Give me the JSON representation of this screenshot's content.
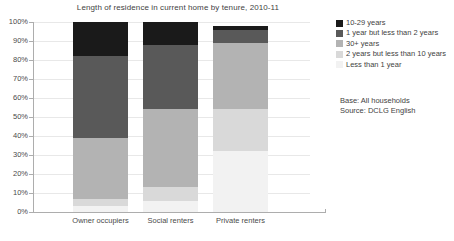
{
  "chart_data": {
    "type": "bar",
    "subtype": "stacked-100-percent",
    "title": "Length of residence in current home by tenure, 2010-11",
    "xlabel": "",
    "ylabel": "",
    "ylim": [
      0,
      100
    ],
    "ytick_labels": [
      "100%",
      "90%",
      "80%",
      "70%",
      "60%",
      "50%",
      "40%",
      "30%",
      "20%",
      "10%",
      "0%"
    ],
    "ytick_values": [
      100,
      90,
      80,
      70,
      60,
      50,
      40,
      30,
      20,
      10,
      0
    ],
    "grid": true,
    "legend_position": "right",
    "categories": [
      "Owner occupiers",
      "Social renters",
      "Private renters"
    ],
    "series": [
      {
        "name": "Less than 1 year",
        "color": "#f2f2f2",
        "values": [
          3,
          6,
          32
        ]
      },
      {
        "name": "2 years but less than 10 years",
        "color": "#d9d9d9",
        "values": [
          4,
          7,
          22
        ]
      },
      {
        "name": "30+ years",
        "color": "#b3b3b3",
        "values": [
          32,
          41,
          35
        ]
      },
      {
        "name": "1 year but less than 2 years",
        "color": "#595959",
        "values": [
          43,
          34,
          7
        ]
      },
      {
        "name": "10-29 years",
        "color": "#1a1a1a",
        "values": [
          18,
          12,
          2
        ]
      }
    ],
    "legend_order": [
      "10-29 years",
      "1 year but less than 2 years",
      "30+ years",
      "2 years but less than 10 years",
      "Less than 1 year"
    ],
    "annotations": [
      "Base: All households",
      "Source: DCLG English"
    ]
  },
  "legend": {
    "items": [
      {
        "label": "10-29 years",
        "color": "#1a1a1a"
      },
      {
        "label": "1 year but less than 2 years",
        "color": "#595959"
      },
      {
        "label": "30+ years",
        "color": "#b3b3b3"
      },
      {
        "label": "2 years but less than 10 years",
        "color": "#d9d9d9"
      },
      {
        "label": "Less than 1 year",
        "color": "#f2f2f2"
      }
    ]
  },
  "footnotes": {
    "base": "Base: All households",
    "source": "Source: DCLG English"
  },
  "colors": {
    "axis": "#adadad",
    "grid": "#e8e8e8",
    "text": "#3f3f3f"
  }
}
